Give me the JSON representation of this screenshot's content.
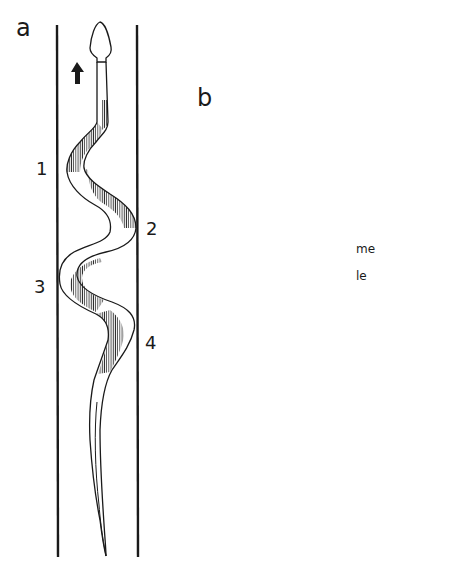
{
  "figure": {
    "panels": [
      {
        "id": "a",
        "label": "a",
        "description": "Snake moving upward between two parallel walls; shaded bands show contracting muscle segments",
        "direction": "up",
        "contact_points": [
          "1",
          "2",
          "3",
          "4"
        ]
      },
      {
        "id": "b",
        "label": "b",
        "description": "Snake moving toward upper-left; hatched band along body with dashed inner line",
        "direction": "up-left",
        "annotations": [
          "me",
          "le"
        ]
      }
    ],
    "colors": {
      "ink": "#1a1a1a",
      "background": "#ffffff",
      "dotted_line": "#8a8a8a"
    }
  }
}
